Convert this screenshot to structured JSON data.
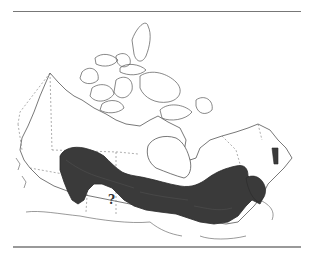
{
  "map": {
    "region": "Canada",
    "legend_marker": "?",
    "range_fill_color": "#3a3a3a",
    "outline_color": "#555555",
    "border_style": "dashed",
    "background": "#ffffff"
  }
}
